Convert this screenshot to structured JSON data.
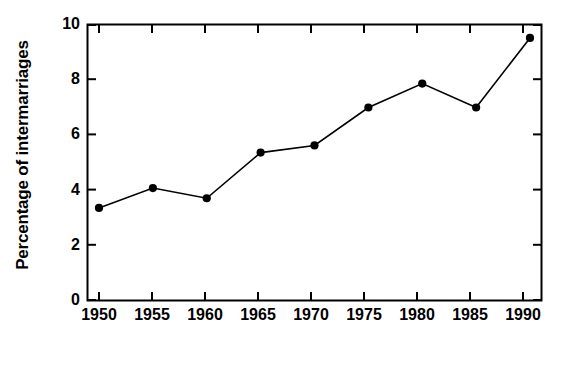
{
  "chart_data": {
    "type": "line",
    "title": "",
    "subtitle": "",
    "xlabel": "Year",
    "ylabel": "Percentage of intermarriages",
    "x": [
      1950,
      1955,
      1960,
      1965,
      1970,
      1975,
      1980,
      1985,
      1990
    ],
    "categories": [
      "1950",
      "1955",
      "1960",
      "1965",
      "1970",
      "1975",
      "1980",
      "1985",
      "1990"
    ],
    "values": [
      3.35,
      4.07,
      3.7,
      5.36,
      5.62,
      7.0,
      7.87,
      7.0,
      9.53
    ],
    "series": [
      {
        "name": "Percentage of intermarriages",
        "values": [
          3.35,
          4.07,
          3.7,
          5.36,
          5.62,
          7.0,
          7.87,
          7.0,
          9.53
        ]
      }
    ],
    "xlim": [
      1950,
      1990
    ],
    "ylim": [
      0,
      10
    ],
    "ytick_labels": [
      "0",
      "2",
      "4",
      "6",
      "8",
      "10"
    ],
    "yticks": [
      0,
      2,
      4,
      6,
      8,
      10
    ],
    "xtick_labels": [
      "1950",
      "1955",
      "1960",
      "1965",
      "1970",
      "1975",
      "1980",
      "1985",
      "1990"
    ],
    "xticks": [
      1950,
      1955,
      1960,
      1965,
      1970,
      1975,
      1980,
      1985,
      1990
    ],
    "grid": false,
    "legend": false,
    "legend_position": "none",
    "line_color": "#000000",
    "marker_color": "#000000",
    "marker": "circle",
    "background_color": "#ffffff",
    "axis_color": "#000000",
    "annotations": []
  }
}
